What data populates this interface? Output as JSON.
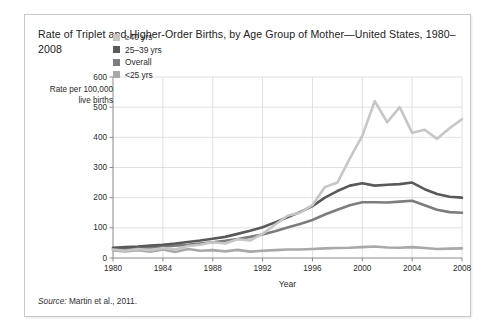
{
  "figure": {
    "title": "Rate of  Triplet and Higher-Order Births, by Age Group of Mother—United States, 1980–2008",
    "source_word": "Source:",
    "source_text": " Martin et al., 2011."
  },
  "legend": {
    "position": "inside-top-left",
    "items": [
      {
        "label": "≥40 yrs",
        "color": "#c6c6c6"
      },
      {
        "label": "25–39 yrs",
        "color": "#595959"
      },
      {
        "label": "Overall",
        "color": "#7d7d7d"
      },
      {
        "label": "<25 yrs",
        "color": "#a8a8a8"
      }
    ]
  },
  "chart_data": {
    "type": "line",
    "title": "Rate of  Triplet and Higher-Order Births, by Age Group of Mother—United States, 1980–2008",
    "xlabel": "Year",
    "ylabel": "Rate per 100,000 live births",
    "xlim": [
      1980,
      2008
    ],
    "ylim": [
      0,
      600
    ],
    "yticks": [
      0,
      100,
      200,
      300,
      400,
      500,
      600
    ],
    "xticks": [
      1980,
      1984,
      1988,
      1992,
      1996,
      2000,
      2004,
      2008
    ],
    "grid": true,
    "x": [
      1980,
      1981,
      1982,
      1983,
      1984,
      1985,
      1986,
      1987,
      1988,
      1989,
      1990,
      1991,
      1992,
      1993,
      1994,
      1995,
      1996,
      1997,
      1998,
      1999,
      2000,
      2001,
      2002,
      2003,
      2004,
      2005,
      2006,
      2007,
      2008
    ],
    "series": [
      {
        "name": "≥40 yrs",
        "color": "#c6c6c6",
        "values": [
          28,
          24,
          30,
          26,
          33,
          28,
          40,
          44,
          52,
          48,
          62,
          58,
          80,
          110,
          140,
          150,
          175,
          235,
          250,
          330,
          405,
          520,
          450,
          500,
          415,
          425,
          395,
          430,
          460
        ]
      },
      {
        "name": "25–39 yrs",
        "color": "#595959",
        "values": [
          34,
          36,
          38,
          41,
          44,
          48,
          53,
          58,
          64,
          70,
          80,
          90,
          102,
          118,
          135,
          152,
          172,
          200,
          222,
          240,
          248,
          240,
          243,
          245,
          250,
          228,
          212,
          203,
          200
        ]
      },
      {
        "name": "Overall",
        "color": "#7d7d7d",
        "values": [
          30,
          31,
          33,
          35,
          38,
          41,
          44,
          48,
          52,
          57,
          63,
          70,
          78,
          89,
          101,
          113,
          126,
          144,
          160,
          175,
          185,
          185,
          184,
          187,
          190,
          175,
          160,
          152,
          150
        ]
      },
      {
        "name": "<25 yrs",
        "color": "#a8a8a8",
        "values": [
          25,
          22,
          26,
          21,
          28,
          20,
          30,
          24,
          26,
          22,
          27,
          21,
          24,
          26,
          28,
          28,
          30,
          32,
          33,
          34,
          36,
          38,
          35,
          34,
          36,
          33,
          30,
          31,
          32
        ]
      }
    ]
  }
}
